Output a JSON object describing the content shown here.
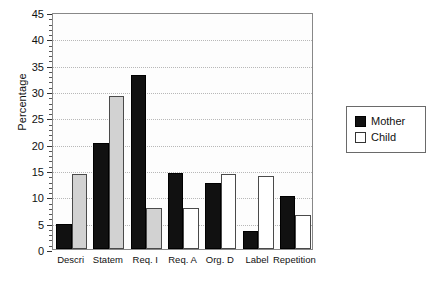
{
  "chart_data": {
    "type": "bar",
    "title": "",
    "subtitle": "",
    "xlabel": "",
    "ylabel": "Percentage",
    "ylim": [
      0,
      45
    ],
    "ytick_step": 5,
    "yticks": [
      0,
      5,
      10,
      15,
      20,
      25,
      30,
      35,
      40,
      45
    ],
    "ytick_labels": [
      "0",
      "5",
      "10",
      "15",
      "20",
      "25",
      "30",
      "35",
      "40",
      "45"
    ],
    "grid": true,
    "grid_axis": "y",
    "grid_style": "dotted",
    "legend_position": "right-outside",
    "categories": [
      "Descri",
      "Statem",
      "Req. I",
      "Req. A",
      "Org. D",
      "Label",
      "Repetition"
    ],
    "series": [
      {
        "name": "Mother",
        "color": "#111111",
        "values": [
          4.7,
          20.1,
          33.0,
          14.5,
          12.6,
          3.5,
          10.1
        ]
      },
      {
        "name": "Child",
        "color": "#ffffff",
        "values": [
          14.2,
          29.0,
          7.8,
          7.8,
          14.3,
          13.8,
          6.5
        ]
      }
    ],
    "annotations": []
  },
  "legend": {
    "entries": [
      {
        "label": "Mother",
        "swatch": "filled-black-square"
      },
      {
        "label": "Child",
        "swatch": "empty-white-square"
      }
    ]
  }
}
